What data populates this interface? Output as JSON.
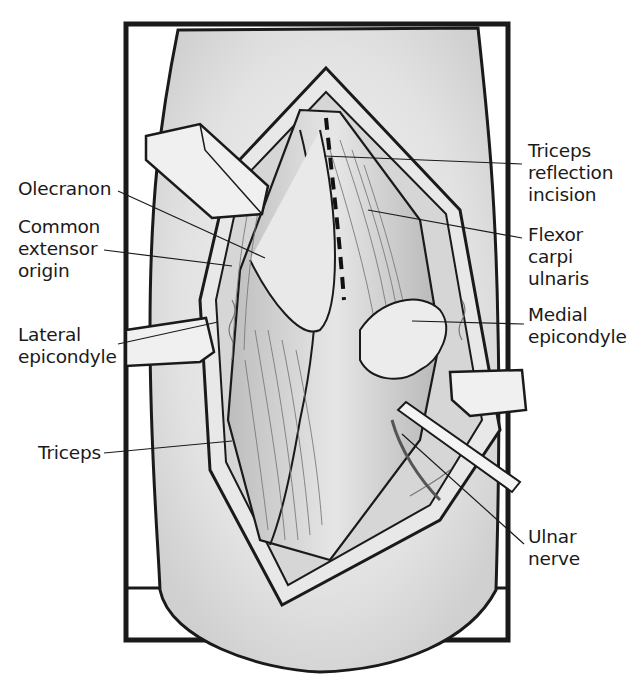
{
  "figure": {
    "colors": {
      "ink": "#1a1a1a",
      "tissue": "#cfcfcf",
      "background": "#ffffff"
    }
  },
  "labels": {
    "olecranon": "Olecranon",
    "common_extensor_origin": "Common\nextensor\norigin",
    "lateral_epicondyle": "Lateral\nepicondyle",
    "triceps": "Triceps",
    "triceps_reflection_incision": "Triceps\nreflection\nincision",
    "flexor_carpi_ulnaris": "Flexor\ncarpi\nulnaris",
    "medial_epicondyle": "Medial\nepicondyle",
    "ulnar_nerve": "Ulnar\nnerve"
  }
}
